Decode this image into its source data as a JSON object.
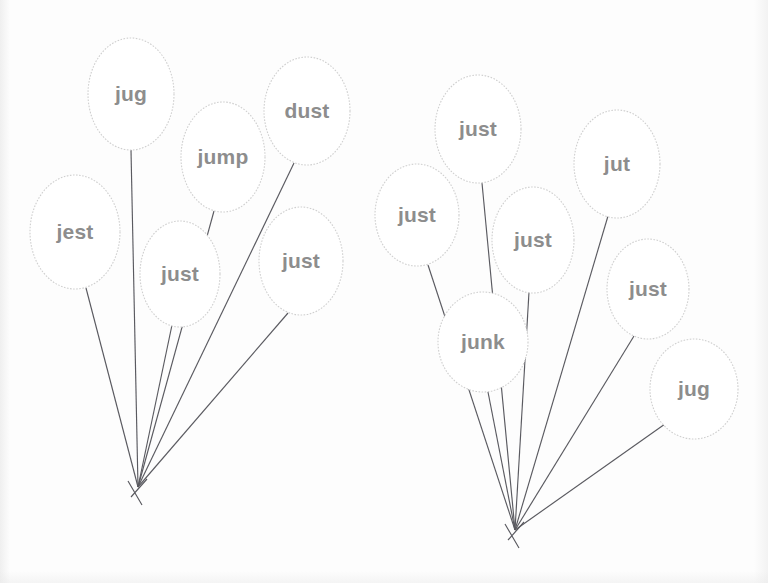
{
  "page": {
    "background_color": "#fdfdfd",
    "balloon_outline_color": "#cfcfcf",
    "label_color": "#8d8d8d",
    "string_color": "#5a5a60"
  },
  "clusters": [
    {
      "name": "left-bunch",
      "knot": {
        "x": 138,
        "y": 487
      },
      "balloons": [
        {
          "label": "jug",
          "cx": 131,
          "cy": 94,
          "rx": 43,
          "ry": 56,
          "tail_x": 131,
          "tail_y": 150
        },
        {
          "label": "jest",
          "cx": 75,
          "cy": 232,
          "rx": 45,
          "ry": 57,
          "tail_x": 86,
          "tail_y": 288
        },
        {
          "label": "jump",
          "cx": 223,
          "cy": 157,
          "rx": 42,
          "ry": 55,
          "tail_x": 214,
          "tail_y": 211
        },
        {
          "label": "dust",
          "cx": 307,
          "cy": 111,
          "rx": 43,
          "ry": 54,
          "tail_x": 294,
          "tail_y": 163
        },
        {
          "label": "just",
          "cx": 180,
          "cy": 274,
          "rx": 40,
          "ry": 53,
          "tail_x": 172,
          "tail_y": 325
        },
        {
          "label": "just",
          "cx": 301,
          "cy": 261,
          "rx": 42,
          "ry": 54,
          "tail_x": 288,
          "tail_y": 313
        }
      ]
    },
    {
      "name": "right-bunch",
      "knot": {
        "x": 515,
        "y": 530
      },
      "balloons": [
        {
          "label": "just",
          "cx": 478,
          "cy": 129,
          "rx": 43,
          "ry": 54,
          "tail_x": 482,
          "tail_y": 183
        },
        {
          "label": "just",
          "cx": 417,
          "cy": 215,
          "rx": 42,
          "ry": 51,
          "tail_x": 428,
          "tail_y": 265
        },
        {
          "label": "jut",
          "cx": 617,
          "cy": 164,
          "rx": 43,
          "ry": 54,
          "tail_x": 608,
          "tail_y": 216
        },
        {
          "label": "just",
          "cx": 533,
          "cy": 240,
          "rx": 41,
          "ry": 53,
          "tail_x": 529,
          "tail_y": 292
        },
        {
          "label": "junk",
          "cx": 483,
          "cy": 342,
          "rx": 45,
          "ry": 50,
          "tail_x": 488,
          "tail_y": 392
        },
        {
          "label": "just",
          "cx": 648,
          "cy": 289,
          "rx": 41,
          "ry": 50,
          "tail_x": 634,
          "tail_y": 336
        },
        {
          "label": "jug",
          "cx": 694,
          "cy": 389,
          "rx": 44,
          "ry": 50,
          "tail_x": 665,
          "tail_y": 424
        }
      ]
    }
  ]
}
